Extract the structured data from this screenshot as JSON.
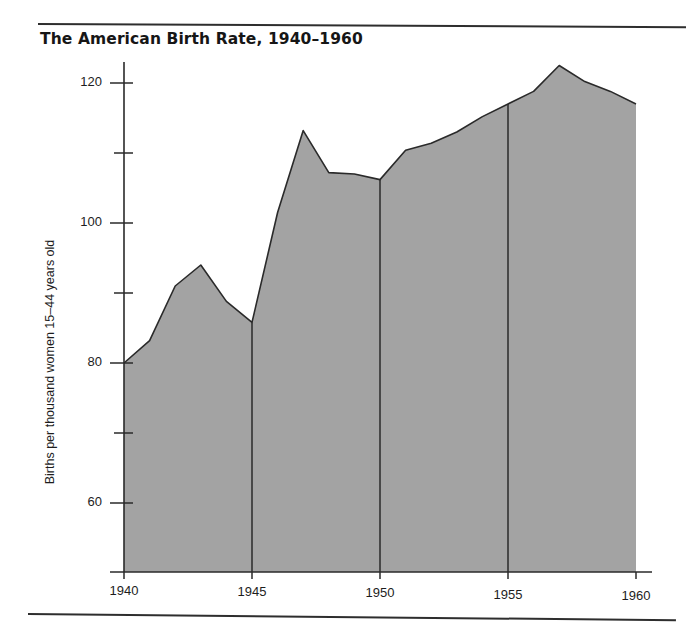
{
  "figure": {
    "title": "The American Birth Rate, 1940–1960",
    "has_top_rule": true,
    "has_bottom_rule": true,
    "background_color": "#ffffff"
  },
  "chart_data": {
    "type": "area",
    "title": "The American Birth Rate, 1940–1960",
    "subtitle": "",
    "xlabel": "",
    "ylabel": "Births per thousand women 15–44 years old",
    "x": [
      1940,
      1941,
      1942,
      1943,
      1944,
      1945,
      1946,
      1947,
      1948,
      1949,
      1950,
      1951,
      1952,
      1953,
      1954,
      1955,
      1956,
      1957,
      1958,
      1959,
      1960
    ],
    "values": [
      80.0,
      83.2,
      91.0,
      94.0,
      88.8,
      85.8,
      101.5,
      113.2,
      107.2,
      107.0,
      106.2,
      110.4,
      111.4,
      113.0,
      115.2,
      117.0,
      118.8,
      122.5,
      120.2,
      118.8,
      117.0
    ],
    "categories": [
      "1940",
      "1941",
      "1942",
      "1943",
      "1944",
      "1945",
      "1946",
      "1947",
      "1948",
      "1949",
      "1950",
      "1951",
      "1952",
      "1953",
      "1954",
      "1955",
      "1956",
      "1957",
      "1958",
      "1959",
      "1960"
    ],
    "series": [
      {
        "name": "Births per thousand women 15–44 years old",
        "values": [
          80.0,
          83.2,
          91.0,
          94.0,
          88.8,
          85.8,
          101.5,
          113.2,
          107.2,
          107.0,
          106.2,
          110.4,
          111.4,
          113.0,
          115.2,
          117.0,
          118.8,
          122.5,
          120.2,
          118.8,
          117.0
        ]
      }
    ],
    "fill_color": "#a3a3a3",
    "line_color": "#2a2a2a",
    "xlim": [
      1940,
      1960
    ],
    "ylim": [
      52.4,
      126.0
    ],
    "grid": false,
    "legend": false,
    "legend_position": "none",
    "y_ticks_major": [
      60,
      80,
      100,
      120
    ],
    "y_tick_labels": [
      "60",
      "80",
      "100",
      "120"
    ],
    "y_ticks_minor": [
      70,
      90,
      110
    ],
    "x_ticks": [
      1940,
      1945,
      1950,
      1955,
      1960
    ],
    "x_tick_labels": [
      "1940",
      "1945",
      "1950",
      "1955",
      "1960"
    ],
    "divider_years": [
      1945,
      1950,
      1955
    ],
    "annotations": []
  },
  "axes": {
    "y_labels": [
      {
        "text": "120",
        "value": 120
      },
      {
        "text": "100",
        "value": 100
      },
      {
        "text": "80",
        "value": 80
      },
      {
        "text": "60",
        "value": 60
      }
    ],
    "x_labels": [
      {
        "text": "1940",
        "value": 1940
      },
      {
        "text": "1945",
        "value": 1945
      },
      {
        "text": "1950",
        "value": 1950
      },
      {
        "text": "1955",
        "value": 1955
      },
      {
        "text": "1960",
        "value": 1960
      }
    ],
    "y_axis_title": "Births per thousand women 15–44 years old"
  }
}
